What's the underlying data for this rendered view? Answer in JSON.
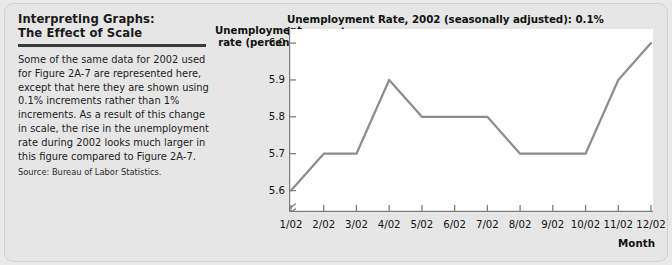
{
  "caption": {
    "title_line1": "Interpreting Graphs:",
    "title_line2": "The Effect of Scale",
    "body": "Some of the same data for 2002 used for Figure 2A-7 are represented here, except that here they are shown using 0.1% increments rather than 1% increments. As a result of this change in scale, the rise in the unemployment rate during 2002 looks much larger in this figure compared to Figure 2A-7.",
    "source": "Source: Bureau of Labor Statistics."
  },
  "chart_data": {
    "type": "line",
    "title": "Unemployment Rate, 2002 (seasonally adjusted): 0.1% increments",
    "xlabel": "Month",
    "ylabel": "Unemployment rate (percent)",
    "ylabel_line1": "Unemployment",
    "ylabel_line2": "rate (percent)",
    "categories": [
      "1/02",
      "2/02",
      "3/02",
      "4/02",
      "5/02",
      "6/02",
      "7/02",
      "8/02",
      "9/02",
      "10/02",
      "11/02",
      "12/02"
    ],
    "values": [
      5.6,
      5.7,
      5.7,
      5.9,
      5.8,
      5.8,
      5.8,
      5.7,
      5.7,
      5.7,
      5.9,
      6.0
    ],
    "ytick_labels": [
      "6.0",
      "5.9",
      "5.8",
      "5.7",
      "5.6"
    ],
    "ytick_values": [
      6.0,
      5.9,
      5.8,
      5.7,
      5.6
    ],
    "ylim": [
      5.55,
      6.03
    ],
    "axis_break": true,
    "grid": false,
    "legend": false,
    "line_color": "#8c8c8c"
  },
  "colors": {
    "panel_background": "#e6e6e6",
    "plot_background": "#ffffff",
    "line": "#8c8c8c",
    "axis": "#7d7d7d",
    "text": "#111111"
  }
}
